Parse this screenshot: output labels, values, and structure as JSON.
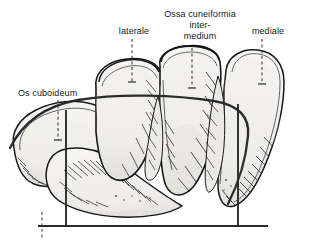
{
  "figure": {
    "background_color": "#ffffff",
    "ink_color": "#17171a",
    "bone_fill_color": "#f2f1ee",
    "bone_fill_shade": "#e6e4df",
    "accent_line_color": "#2b2b2e",
    "leader_line_color": "#45454a"
  },
  "labels": {
    "cuboideum": "Os cuboideum",
    "laterale": "laterale",
    "ossa_title": "Ossa cuneiformia",
    "ossa_line2": "inter-",
    "ossa_line3": "medium",
    "mediale": "mediale"
  },
  "annotations": {
    "leader_cuboideum": "dashed-leader-line",
    "leader_laterale": "dashed-leader-line",
    "leader_intermedium": "dashed-leader-line",
    "leader_mediale": "dashed-leader-line",
    "baseline": "horizontal-reference-line",
    "vertical_left": "vertical-reference-line",
    "vertical_right": "vertical-reference-line",
    "arc": "transverse-arch-curve"
  }
}
